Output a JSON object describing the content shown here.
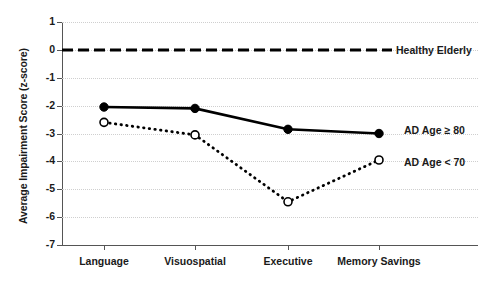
{
  "chart_data": {
    "type": "line",
    "title": "",
    "xlabel": "",
    "ylabel": "Average Impairment Score (z-score)",
    "categories": [
      "Language",
      "Visuospatial",
      "Executive",
      "Memory Savings"
    ],
    "ylim": [
      -7,
      1
    ],
    "yticks": [
      1,
      0,
      -1,
      -2,
      -3,
      -4,
      -5,
      -6,
      -7
    ],
    "ytick_labels": [
      "1",
      "0",
      "-1",
      "-2",
      "-3",
      "-4",
      "-5",
      "-6",
      "-7"
    ],
    "grid": true,
    "legend_position": "inline-right",
    "series": [
      {
        "name": "Healthy Elderly",
        "label": "Healthy Elderly",
        "style": "dashed",
        "marker": "none",
        "color": "#000000",
        "values": [
          0,
          0,
          0,
          0
        ]
      },
      {
        "name": "AD Age ≥ 80",
        "label": "AD Age ≥ 80",
        "style": "solid",
        "marker": "filled-circle",
        "color": "#000000",
        "values": [
          -2.05,
          -2.1,
          -2.85,
          -3.0
        ]
      },
      {
        "name": "AD Age < 70",
        "label": "AD Age < 70",
        "style": "dotted",
        "marker": "open-circle",
        "color": "#000000",
        "values": [
          -2.6,
          -3.05,
          -5.45,
          -3.95
        ]
      }
    ]
  },
  "axis": {
    "y_title": "Average Impairment Score (z-score)",
    "y_labels": [
      "1",
      "0",
      "-1",
      "-2",
      "-3",
      "-4",
      "-5",
      "-6",
      "-7"
    ],
    "x_labels": [
      "Language",
      "Visuospatial",
      "Executive",
      "Memory Savings"
    ]
  },
  "annotations": {
    "healthy_elderly": "Healthy Elderly",
    "ad_age_ge_80": "AD Age ≥ 80",
    "ad_age_lt_70": "AD Age < 70"
  }
}
